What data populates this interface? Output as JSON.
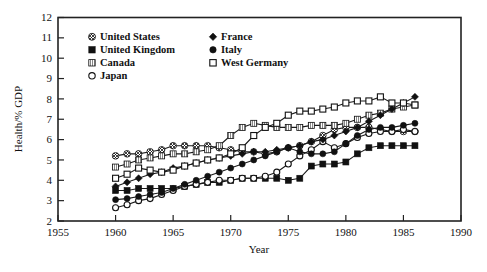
{
  "chart_data": {
    "type": "line",
    "title": "",
    "xlabel": "Year",
    "ylabel": "Health/% GDP",
    "xlim": [
      1955,
      1990
    ],
    "ylim": [
      2,
      12
    ],
    "xticks": [
      "1955",
      "1960",
      "1965",
      "1970",
      "1975",
      "1980",
      "1985",
      "1990"
    ],
    "yticks": [
      "2",
      "3",
      "4",
      "5",
      "6",
      "7",
      "8",
      "9",
      "10",
      "11",
      "12"
    ],
    "grid": false,
    "legend_position": "top-left-inside",
    "x": [
      1960,
      1961,
      1962,
      1963,
      1964,
      1965,
      1966,
      1967,
      1968,
      1969,
      1970,
      1971,
      1972,
      1973,
      1974,
      1975,
      1976,
      1977,
      1978,
      1979,
      1980,
      1981,
      1982,
      1983,
      1984,
      1985,
      1986
    ],
    "series": [
      {
        "name": "United States",
        "marker": "crossed-circle",
        "fill": "#808080",
        "values": [
          5.2,
          5.3,
          5.3,
          5.4,
          5.5,
          5.7,
          5.7,
          5.7,
          5.7,
          5.6,
          5.5,
          5.4,
          5.4,
          5.3,
          5.4,
          5.6,
          5.7,
          5.9,
          6.2,
          6.5,
          6.6,
          6.6,
          6.6,
          6.5,
          6.4,
          6.4,
          6.4
        ]
      },
      {
        "name": "United Kingdom",
        "marker": "filled-square",
        "fill": "#111111",
        "values": [
          3.5,
          3.5,
          3.6,
          3.6,
          3.6,
          3.6,
          3.7,
          3.8,
          3.9,
          3.9,
          4.0,
          4.1,
          4.1,
          4.1,
          4.1,
          4.0,
          4.1,
          4.7,
          4.8,
          4.8,
          4.9,
          5.3,
          5.6,
          5.7,
          5.7,
          5.7,
          5.7
        ]
      },
      {
        "name": "Canada",
        "marker": "hatched-square",
        "fill": "#777777",
        "values": [
          4.65,
          4.8,
          5.0,
          5.1,
          5.2,
          5.3,
          5.3,
          5.4,
          5.5,
          5.7,
          6.2,
          6.6,
          6.8,
          6.7,
          6.6,
          6.6,
          6.6,
          6.7,
          6.7,
          6.7,
          6.8,
          7.0,
          7.2,
          7.3,
          7.5,
          7.6,
          7.7
        ]
      },
      {
        "name": "Japan",
        "marker": "open-circle",
        "fill": "#ffffff",
        "values": [
          2.65,
          2.8,
          3.0,
          3.1,
          3.3,
          3.5,
          3.7,
          3.8,
          3.9,
          4.0,
          4.0,
          4.1,
          4.1,
          4.2,
          4.4,
          4.8,
          5.2,
          5.5,
          5.9,
          5.6,
          5.8,
          6.1,
          6.3,
          6.4,
          6.4,
          6.5,
          6.4
        ]
      },
      {
        "name": "France",
        "marker": "filled-diamond",
        "fill": "#111111",
        "values": [
          3.7,
          3.9,
          4.1,
          4.3,
          4.4,
          4.6,
          4.7,
          4.85,
          5.0,
          5.1,
          5.2,
          5.3,
          5.4,
          5.4,
          5.5,
          5.6,
          5.7,
          5.9,
          6.0,
          6.2,
          6.4,
          6.6,
          6.9,
          7.2,
          7.5,
          7.8,
          8.1
        ]
      },
      {
        "name": "Italy",
        "marker": "filled-circle",
        "fill": "#111111",
        "values": [
          3.05,
          3.1,
          3.2,
          3.3,
          3.4,
          3.6,
          3.8,
          4.0,
          4.2,
          4.4,
          4.6,
          4.8,
          5.0,
          5.2,
          5.4,
          5.6,
          5.4,
          5.3,
          5.3,
          5.4,
          5.8,
          6.2,
          6.5,
          6.6,
          6.6,
          6.7,
          6.8
        ]
      },
      {
        "name": "West Germany",
        "marker": "open-square",
        "fill": "#ffffff",
        "values": [
          4.1,
          4.3,
          4.6,
          4.5,
          4.4,
          4.5,
          4.7,
          4.85,
          5.0,
          5.1,
          5.3,
          5.6,
          6.2,
          6.6,
          6.8,
          7.2,
          7.4,
          7.4,
          7.5,
          7.6,
          7.8,
          7.9,
          7.9,
          8.1,
          7.8,
          7.8,
          7.7
        ]
      }
    ]
  },
  "legend": {
    "entries": [
      {
        "label": "United States",
        "marker": "crossed-circle"
      },
      {
        "label": "United Kingdom",
        "marker": "filled-square"
      },
      {
        "label": "Canada",
        "marker": "hatched-square"
      },
      {
        "label": "Japan",
        "marker": "open-circle"
      },
      {
        "label": "France",
        "marker": "filled-diamond"
      },
      {
        "label": "Italy",
        "marker": "filled-circle"
      },
      {
        "label": "West Germany",
        "marker": "open-square"
      }
    ]
  },
  "colors": {
    "axis": "#222222",
    "line": "#1a1a1a",
    "background": "#ffffff",
    "grey_marker": "#808080"
  },
  "axes": {
    "y_title": "Health/% GDP",
    "x_title": "Year"
  }
}
